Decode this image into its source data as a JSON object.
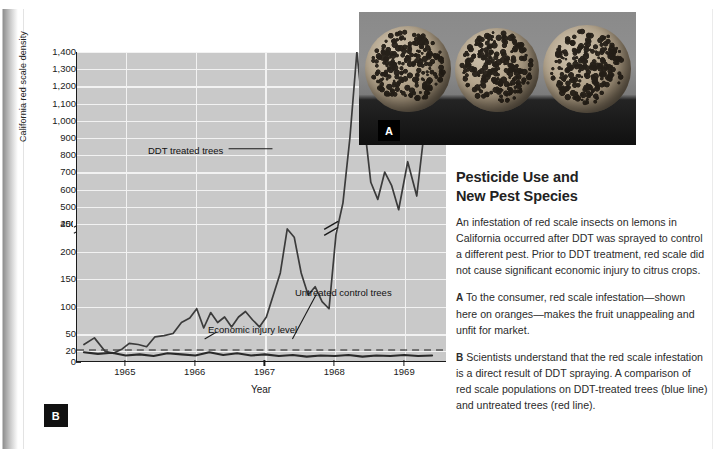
{
  "figure_b": {
    "badge": "B",
    "annotations": {
      "ddt_label": "DDT treated trees",
      "untreated_label": "Untreated control trees",
      "injury_label": "Economic injury level"
    }
  },
  "figure_a": {
    "badge": "A",
    "photo_caption": "three speckled oranges on gray background"
  },
  "sidebar": {
    "title_line1": "Pesticide Use and",
    "title_line2": "New Pest Species",
    "intro": "An infestation of red scale insects on lemons in California  occurred after DDT was sprayed to control a different pest. Prior to DDT treatment, red scale did not cause significant economic injury to citrus crops.",
    "para_a_lead": "A",
    "para_a": " To the consumer, red scale infestation—shown here on oranges—makes the fruit unappealing and unfit for market.",
    "para_b_lead": "B",
    "para_b": " Scientists understand that the red scale infestation is a direct result of DDT spraying. A comparison of red scale populations on DDT-treated trees (blue line) and untreated trees (red line)."
  },
  "chart_data": {
    "type": "line",
    "title": "",
    "xlabel": "Year",
    "ylabel": "California red scale density",
    "grid": true,
    "legend_position": "inline-annotations",
    "axis_break": {
      "between": [
        250,
        400
      ],
      "axis": "y"
    },
    "ytick_labels": [
      "0",
      "20",
      "50",
      "100",
      "150",
      "200",
      "250",
      "400",
      "500",
      "600",
      "700",
      "800",
      "900",
      "1,000",
      "1,100",
      "1,200",
      "1,300",
      "1,400"
    ],
    "xtick_labels": [
      "1965",
      "1966",
      "1967",
      "1968",
      "1969"
    ],
    "xlim": [
      1964.3,
      1969.6
    ],
    "ylim_lower": [
      0,
      250
    ],
    "ylim_upper": [
      400,
      1400
    ],
    "reference_lines": [
      {
        "name": "Economic injury level",
        "value": 20,
        "style": "dashed"
      }
    ],
    "series": [
      {
        "name": "DDT treated trees",
        "color": "#3b3b3b",
        "x": [
          1964.4,
          1964.55,
          1964.7,
          1964.82,
          1964.95,
          1965.05,
          1965.18,
          1965.3,
          1965.42,
          1965.55,
          1965.68,
          1965.8,
          1965.92,
          1966.02,
          1966.12,
          1966.22,
          1966.32,
          1966.42,
          1966.52,
          1966.62,
          1966.72,
          1966.82,
          1966.92,
          1967.02,
          1967.12,
          1967.22,
          1967.32,
          1967.42,
          1967.52,
          1967.62,
          1967.72,
          1967.82,
          1967.92,
          1968.02,
          1968.12,
          1968.22,
          1968.32,
          1968.42,
          1968.52,
          1968.62,
          1968.72,
          1968.82,
          1968.92,
          1969.05,
          1969.18,
          1969.3,
          1969.42
        ],
        "y": [
          30,
          42,
          18,
          14,
          22,
          32,
          30,
          26,
          44,
          46,
          50,
          70,
          78,
          95,
          60,
          88,
          70,
          80,
          62,
          80,
          90,
          75,
          62,
          80,
          120,
          160,
          240,
          225,
          160,
          120,
          135,
          108,
          95,
          230,
          520,
          900,
          1400,
          1000,
          640,
          540,
          700,
          620,
          480,
          760,
          560,
          980,
          1020
        ]
      },
      {
        "name": "Untreated control trees",
        "color": "#2a2a2a",
        "x": [
          1964.4,
          1964.6,
          1964.8,
          1965.0,
          1965.2,
          1965.4,
          1965.6,
          1965.8,
          1966.0,
          1966.2,
          1966.4,
          1966.6,
          1966.8,
          1967.0,
          1967.2,
          1967.4,
          1967.6,
          1967.8,
          1968.0,
          1968.2,
          1968.4,
          1968.6,
          1968.8,
          1969.0,
          1969.2,
          1969.4
        ],
        "y": [
          16,
          13,
          15,
          10,
          12,
          9,
          14,
          12,
          10,
          16,
          11,
          14,
          10,
          12,
          9,
          11,
          8,
          10,
          9,
          11,
          8,
          10,
          9,
          11,
          9,
          10
        ]
      }
    ]
  }
}
